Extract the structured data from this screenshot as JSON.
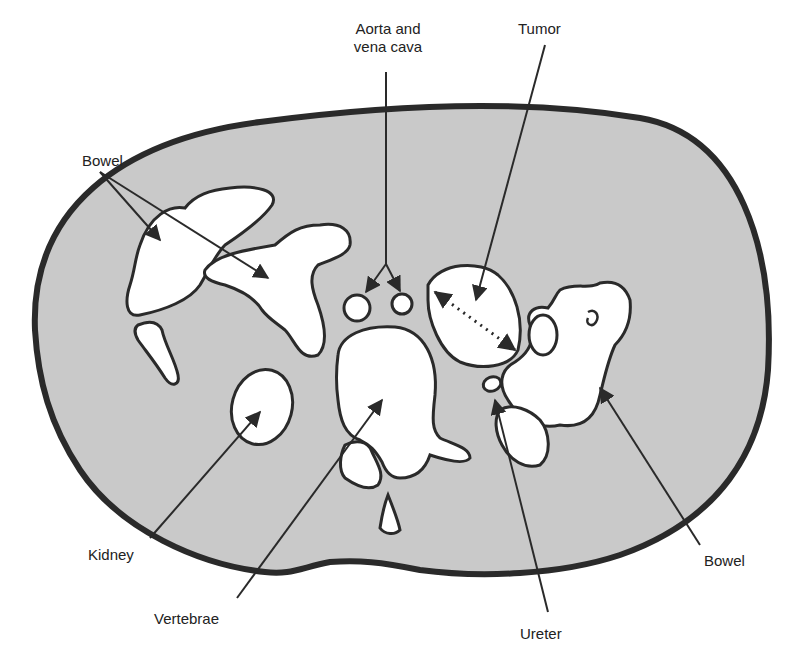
{
  "diagram": {
    "type": "anatomical cross-section (CT schematic, abdomen)",
    "colors": {
      "body_fill": "#c9c9c9",
      "outline": "#2a2a2a",
      "organ_fill": "#ffffff",
      "background": "#ffffff"
    }
  },
  "labels": {
    "aorta": {
      "line1": "Aorta and",
      "line2": "vena cava"
    },
    "tumor": "Tumor",
    "bowel_left": "Bowel",
    "kidney": "Kidney",
    "vertebrae": "Vertebrae",
    "ureter": "Ureter",
    "bowel_right": "Bowel"
  }
}
